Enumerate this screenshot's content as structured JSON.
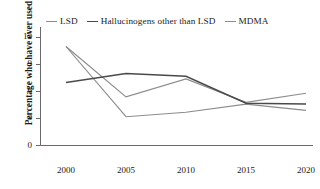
{
  "chart_data": {
    "type": "line",
    "title": "",
    "xlabel": "",
    "ylabel": "Percentage who have ever used",
    "x": [
      2000,
      2005,
      2010,
      2015,
      2020
    ],
    "xtick_labels": [
      "2000",
      "2005",
      "2010",
      "2015",
      "2020"
    ],
    "ytick_labels": [
      "0",
      "3",
      "6",
      "9",
      "12"
    ],
    "ytick_values": [
      0,
      3,
      6,
      9,
      12
    ],
    "ylim": [
      0,
      13
    ],
    "xlim": [
      1998,
      2022
    ],
    "grid": false,
    "legend_position": "top",
    "series": [
      {
        "name": "LSD",
        "color": "#8c8c8c",
        "values": [
          11.0,
          5.4,
          7.4,
          4.8,
          5.8
        ]
      },
      {
        "name": "Hallucinogens other than LSD",
        "color": "#4a4a4a",
        "values": [
          7.0,
          8.0,
          7.7,
          4.7,
          4.6
        ]
      },
      {
        "name": "MDMA",
        "color": "#8c8c8c",
        "values": [
          11.0,
          3.2,
          3.7,
          4.6,
          3.9
        ]
      }
    ]
  },
  "legend": {
    "items": [
      {
        "label": "LSD",
        "color": "#8c8c8c"
      },
      {
        "label": "Hallucinogens other than LSD",
        "color": "#4a4a4a"
      },
      {
        "label": "MDMA",
        "color": "#8c8c8c"
      }
    ]
  },
  "axes": {
    "y_title": "Percentage who have ever used",
    "axis_color": "#6b6b6b"
  }
}
